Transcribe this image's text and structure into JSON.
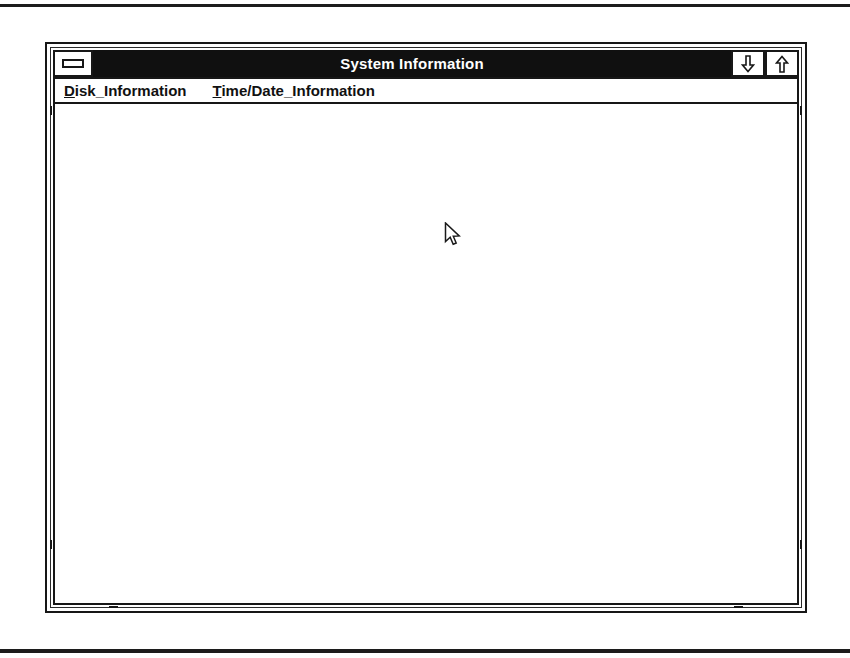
{
  "window": {
    "title": "System Information",
    "system_menu_icon": "window-menu-bar-icon",
    "minimize_icon": "arrow-down-icon",
    "maximize_icon": "arrow-up-icon"
  },
  "menubar": {
    "items": [
      {
        "label": "Disk_Information",
        "mnemonic": "D",
        "rest": "isk_Information"
      },
      {
        "label": "Time/Date_Information",
        "mnemonic": "T",
        "rest": "ime/Date_Information"
      }
    ]
  },
  "client": {
    "content": ""
  },
  "cursor": {
    "icon": "arrow-pointer-icon",
    "x": 389,
    "y": 118
  },
  "colors": {
    "titlebar_background": "#101010",
    "titlebar_text": "#ffffff",
    "frame_line": "#171717",
    "window_background": "#ffffff",
    "menu_text": "#111111"
  }
}
